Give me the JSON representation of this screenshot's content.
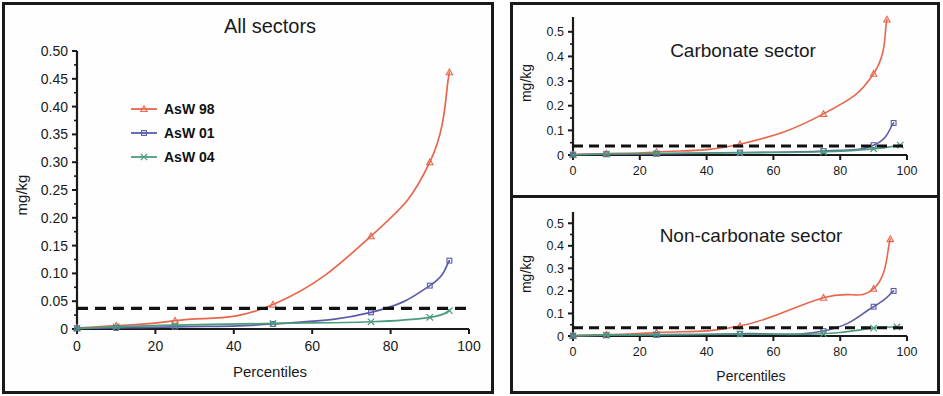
{
  "figure": {
    "background": "#ffffff",
    "frame_color": "#1a1a1a"
  },
  "series_colors": {
    "AsW 98": "#e8664c",
    "AsW 01": "#5b5ba8",
    "AsW 04": "#4c9b7d",
    "threshold": "#111111"
  },
  "legend": {
    "items": [
      {
        "label": "AsW 98",
        "color": "#e8664c",
        "marker": "triangle"
      },
      {
        "label": "AsW 01",
        "color": "#5b5ba8",
        "marker": "square"
      },
      {
        "label": "AsW 04",
        "color": "#4c9b7d",
        "marker": "cross"
      }
    ]
  },
  "panels": {
    "all_sectors": {
      "title": "All sectors",
      "xlabel": "Percentiles",
      "ylabel": "mg/kg",
      "xticks": [
        0,
        20,
        40,
        60,
        80,
        100
      ],
      "yticks": [
        "0",
        "0.05",
        "0.10",
        "0.15",
        "0.20",
        "0.25",
        "0.30",
        "0.35",
        "0.40",
        "0.45",
        "0.50"
      ],
      "ytick_values": [
        0,
        0.05,
        0.1,
        0.15,
        0.2,
        0.25,
        0.3,
        0.35,
        0.4,
        0.45,
        0.5
      ],
      "yminor_step": 0.025,
      "xlim": [
        0,
        100
      ],
      "ylim": [
        0,
        0.5
      ]
    },
    "carbonate": {
      "title": "Carbonate sector",
      "xlabel": "",
      "ylabel": "mg/kg",
      "xticks": [
        0,
        20,
        40,
        60,
        80,
        100
      ],
      "yticks": [
        "0",
        "0.1",
        "0.2",
        "0.3",
        "0.4",
        "0.5"
      ],
      "ytick_values": [
        0,
        0.1,
        0.2,
        0.3,
        0.4,
        0.5
      ],
      "yminor_step": 0.05,
      "xlim": [
        0,
        100
      ],
      "ylim": [
        0,
        0.56
      ]
    },
    "non_carbonate": {
      "title": "Non-carbonate sector",
      "xlabel": "Percentiles",
      "ylabel": "mg/kg",
      "xticks": [
        0,
        20,
        40,
        60,
        80,
        100
      ],
      "yticks": [
        "0",
        "0.1",
        "0.2",
        "0.3",
        "0.4",
        "0.5"
      ],
      "ytick_values": [
        0,
        0.1,
        0.2,
        0.3,
        0.4,
        0.5
      ],
      "yminor_step": 0.05,
      "xlim": [
        0,
        100
      ],
      "ylim": [
        0,
        0.55
      ]
    }
  },
  "chart_data": [
    {
      "id": "all_sectors",
      "type": "line",
      "title": "All sectors",
      "xlabel": "Percentiles",
      "ylabel": "mg/kg",
      "xlim": [
        0,
        100
      ],
      "ylim": [
        0,
        0.5
      ],
      "grid": false,
      "legend_position": "upper-left-inside",
      "threshold_line": {
        "value": 0.037,
        "style": "dashed",
        "color": "#111111"
      },
      "series": [
        {
          "name": "AsW 98",
          "color": "#e8664c",
          "marker": "triangle",
          "x": [
            0,
            10,
            25,
            50,
            75,
            90,
            95
          ],
          "values": [
            0.002,
            0.006,
            0.015,
            0.044,
            0.167,
            0.3,
            0.462
          ]
        },
        {
          "name": "AsW 01",
          "color": "#5b5ba8",
          "marker": "square",
          "x": [
            0,
            10,
            25,
            50,
            75,
            90,
            95
          ],
          "values": [
            0.001,
            0.002,
            0.004,
            0.009,
            0.03,
            0.078,
            0.123
          ]
        },
        {
          "name": "AsW 04",
          "color": "#4c9b7d",
          "marker": "cross",
          "x": [
            0,
            10,
            25,
            50,
            75,
            90,
            95
          ],
          "values": [
            0.001,
            0.004,
            0.007,
            0.01,
            0.013,
            0.021,
            0.033
          ]
        }
      ]
    },
    {
      "id": "carbonate",
      "type": "line",
      "title": "Carbonate sector",
      "xlabel": "",
      "ylabel": "mg/kg",
      "xlim": [
        0,
        100
      ],
      "ylim": [
        0,
        0.56
      ],
      "grid": false,
      "legend_position": "none",
      "threshold_line": {
        "value": 0.037,
        "style": "dashed",
        "color": "#111111"
      },
      "series": [
        {
          "name": "AsW 98",
          "color": "#e8664c",
          "marker": "triangle",
          "x": [
            0,
            10,
            25,
            50,
            75,
            90,
            94
          ],
          "values": [
            0.002,
            0.006,
            0.012,
            0.044,
            0.167,
            0.33,
            0.55
          ]
        },
        {
          "name": "AsW 01",
          "color": "#5b5ba8",
          "marker": "square",
          "x": [
            0,
            10,
            25,
            50,
            75,
            90,
            96
          ],
          "values": [
            0.001,
            0.003,
            0.005,
            0.01,
            0.016,
            0.04,
            0.13
          ]
        },
        {
          "name": "AsW 04",
          "color": "#4c9b7d",
          "marker": "cross",
          "x": [
            0,
            10,
            25,
            50,
            75,
            90,
            98
          ],
          "values": [
            0.001,
            0.004,
            0.006,
            0.009,
            0.013,
            0.025,
            0.04
          ]
        }
      ]
    },
    {
      "id": "non_carbonate",
      "type": "line",
      "title": "Non-carbonate sector",
      "xlabel": "Percentiles",
      "ylabel": "mg/kg",
      "xlim": [
        0,
        100
      ],
      "ylim": [
        0,
        0.55
      ],
      "grid": false,
      "legend_position": "none",
      "threshold_line": {
        "value": 0.037,
        "style": "dashed",
        "color": "#111111"
      },
      "series": [
        {
          "name": "AsW 98",
          "color": "#e8664c",
          "marker": "triangle",
          "x": [
            0,
            10,
            25,
            50,
            75,
            90,
            95
          ],
          "values": [
            0.002,
            0.006,
            0.015,
            0.044,
            0.17,
            0.21,
            0.43
          ]
        },
        {
          "name": "AsW 01",
          "color": "#5b5ba8",
          "marker": "square",
          "x": [
            0,
            10,
            25,
            50,
            75,
            90,
            96
          ],
          "values": [
            0.001,
            0.003,
            0.005,
            0.01,
            0.022,
            0.13,
            0.2
          ]
        },
        {
          "name": "AsW 04",
          "color": "#4c9b7d",
          "marker": "cross",
          "x": [
            0,
            10,
            25,
            50,
            75,
            90,
            97
          ],
          "values": [
            0.001,
            0.004,
            0.006,
            0.008,
            0.01,
            0.035,
            0.04
          ]
        }
      ]
    }
  ]
}
